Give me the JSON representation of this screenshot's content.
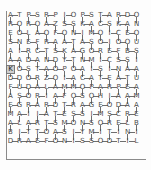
{
  "puzzle": {
    "title": "letter-grid-puzzle",
    "type": "word-grid",
    "rows": 15,
    "cols": 15,
    "cell_size": 9,
    "origin_x": 6,
    "origin_y": 11,
    "colors": {
      "background": "#fdfdfd",
      "letter": "#4a4a4a",
      "link": "#6e6e6e",
      "selection_fill": "#cfcfcf",
      "selection_border": "#7a7a7a",
      "frame": "#8a8a8a"
    },
    "selected_cell": {
      "row": 6,
      "col": 0,
      "letter": "K"
    },
    "letters": [
      [
        "A",
        "T",
        "P",
        "S",
        "R",
        "P",
        "I",
        "O",
        "P",
        "S",
        "T",
        "A",
        "R",
        "D",
        "O"
      ],
      [
        "R",
        "O",
        "R",
        "O",
        "A",
        "Z",
        "S",
        "S",
        "K",
        "A",
        "C",
        "S",
        "K",
        "A",
        "N"
      ],
      [
        "E",
        "O",
        "L",
        "A",
        "O",
        "F",
        "O",
        "N",
        "I",
        "M",
        "O",
        "I",
        "C",
        "E",
        "O"
      ],
      [
        "S",
        "N",
        "E",
        "F",
        "R",
        "A",
        "A",
        "T",
        "A",
        "S",
        "O",
        "I",
        "O",
        "O",
        "U"
      ],
      [
        "A",
        "I",
        "R",
        "C",
        "T",
        "S",
        "K",
        "A",
        "G",
        "O",
        "R",
        "E",
        "F",
        "B",
        "S"
      ],
      [
        "A",
        "A",
        "D",
        "A",
        "N",
        "D",
        "Y",
        "T",
        "N",
        "M",
        "I",
        "C",
        "S",
        "S",
        "I"
      ],
      [
        "K",
        "O",
        "S",
        "T",
        "A",
        "O",
        "P",
        "O",
        "A",
        "I",
        "S",
        "I",
        "N",
        "A",
        "A"
      ],
      [
        "D",
        "D",
        "O",
        "R",
        "Z",
        "O",
        "I",
        "A",
        "C",
        "A",
        "T",
        "E",
        "A",
        "T",
        "U"
      ],
      [
        "F",
        "U",
        "D",
        "A",
        "L",
        "A",
        "M",
        "M",
        "O",
        "P",
        "A",
        "R",
        "P",
        "E",
        "A"
      ],
      [
        "A",
        "S",
        "O",
        "R",
        "I",
        "A",
        "F",
        "O",
        "S",
        "O",
        "H",
        "I",
        "A",
        "A",
        "M"
      ],
      [
        "E",
        "G",
        "R",
        "A",
        "R",
        "D",
        "T",
        "R",
        "A",
        "G",
        "E",
        "O",
        "D",
        "A",
        "A"
      ],
      [
        "M",
        "A",
        "I",
        "I",
        "A",
        "T",
        "E",
        "S",
        "S",
        "I",
        "M",
        "S",
        "C",
        "R",
        "E"
      ],
      [
        "A",
        "L",
        "A",
        "R",
        "T",
        "S",
        "M",
        "O",
        "N",
        "S",
        "O",
        "R",
        "E",
        "L",
        "B"
      ],
      [
        "B",
        "I",
        "T",
        "T",
        "O",
        "A",
        "S",
        "I",
        "Y",
        "M",
        "I",
        "T",
        "I",
        "N",
        "I"
      ],
      [
        "D",
        "R",
        "A",
        "E",
        "F",
        "O",
        "N",
        "I",
        "S",
        "S",
        "O",
        "D",
        "T",
        "I",
        "L"
      ]
    ],
    "links": {
      "horizontal": [
        [
          0,
          0
        ],
        [
          0,
          2
        ],
        [
          0,
          4
        ],
        [
          0,
          6
        ],
        [
          0,
          8
        ],
        [
          0,
          10
        ],
        [
          0,
          12
        ],
        [
          0,
          13
        ],
        [
          1,
          0
        ],
        [
          1,
          2
        ],
        [
          1,
          4
        ],
        [
          1,
          6
        ],
        [
          1,
          8
        ],
        [
          1,
          10
        ],
        [
          1,
          12
        ],
        [
          2,
          1
        ],
        [
          2,
          3
        ],
        [
          2,
          5
        ],
        [
          2,
          7
        ],
        [
          2,
          9
        ],
        [
          2,
          11
        ],
        [
          2,
          13
        ],
        [
          3,
          0
        ],
        [
          3,
          2
        ],
        [
          3,
          4
        ],
        [
          3,
          6
        ],
        [
          3,
          8
        ],
        [
          3,
          10
        ],
        [
          3,
          12
        ],
        [
          4,
          1
        ],
        [
          4,
          3
        ],
        [
          4,
          5
        ],
        [
          4,
          7
        ],
        [
          4,
          9
        ],
        [
          4,
          11
        ],
        [
          4,
          13
        ],
        [
          5,
          0
        ],
        [
          5,
          2
        ],
        [
          5,
          4
        ],
        [
          5,
          6
        ],
        [
          5,
          8
        ],
        [
          5,
          10
        ],
        [
          5,
          12
        ],
        [
          6,
          1
        ],
        [
          6,
          3
        ],
        [
          6,
          4
        ],
        [
          6,
          5
        ],
        [
          6,
          7
        ],
        [
          6,
          9
        ],
        [
          6,
          11
        ],
        [
          6,
          13
        ],
        [
          7,
          0
        ],
        [
          7,
          2
        ],
        [
          7,
          4
        ],
        [
          7,
          6
        ],
        [
          7,
          8
        ],
        [
          7,
          10
        ],
        [
          7,
          12
        ],
        [
          8,
          0
        ],
        [
          8,
          1
        ],
        [
          8,
          2
        ],
        [
          8,
          3
        ],
        [
          8,
          4
        ],
        [
          8,
          5
        ],
        [
          8,
          6
        ],
        [
          8,
          7
        ],
        [
          8,
          8
        ],
        [
          8,
          9
        ],
        [
          8,
          10
        ],
        [
          8,
          11
        ],
        [
          8,
          12
        ],
        [
          8,
          13
        ],
        [
          9,
          1
        ],
        [
          9,
          3
        ],
        [
          9,
          5
        ],
        [
          9,
          7
        ],
        [
          9,
          9
        ],
        [
          9,
          11
        ],
        [
          9,
          13
        ],
        [
          10,
          0
        ],
        [
          10,
          2
        ],
        [
          10,
          4
        ],
        [
          10,
          6
        ],
        [
          10,
          8
        ],
        [
          10,
          10
        ],
        [
          10,
          12
        ],
        [
          11,
          1
        ],
        [
          11,
          3
        ],
        [
          11,
          5
        ],
        [
          11,
          7
        ],
        [
          11,
          9
        ],
        [
          11,
          11
        ],
        [
          11,
          13
        ],
        [
          12,
          0
        ],
        [
          12,
          2
        ],
        [
          12,
          4
        ],
        [
          12,
          6
        ],
        [
          12,
          8
        ],
        [
          12,
          10
        ],
        [
          12,
          12
        ],
        [
          13,
          1
        ],
        [
          13,
          3
        ],
        [
          13,
          5
        ],
        [
          13,
          7
        ],
        [
          13,
          9
        ],
        [
          13,
          11
        ],
        [
          13,
          13
        ],
        [
          14,
          0
        ],
        [
          14,
          1
        ],
        [
          14,
          2
        ],
        [
          14,
          3
        ],
        [
          14,
          4
        ],
        [
          14,
          5
        ],
        [
          14,
          6
        ],
        [
          14,
          7
        ],
        [
          14,
          8
        ],
        [
          14,
          9
        ],
        [
          14,
          10
        ],
        [
          14,
          11
        ],
        [
          14,
          12
        ],
        [
          14,
          13
        ]
      ],
      "vertical": [
        [
          0,
          0
        ],
        [
          0,
          2
        ],
        [
          0,
          4
        ],
        [
          0,
          6
        ],
        [
          0,
          8
        ],
        [
          0,
          10
        ],
        [
          0,
          12
        ],
        [
          0,
          14
        ],
        [
          1,
          1
        ],
        [
          1,
          3
        ],
        [
          1,
          5
        ],
        [
          1,
          7
        ],
        [
          1,
          9
        ],
        [
          1,
          11
        ],
        [
          1,
          13
        ],
        [
          2,
          0
        ],
        [
          2,
          2
        ],
        [
          2,
          4
        ],
        [
          2,
          6
        ],
        [
          2,
          8
        ],
        [
          2,
          10
        ],
        [
          2,
          12
        ],
        [
          2,
          14
        ],
        [
          3,
          1
        ],
        [
          3,
          3
        ],
        [
          3,
          5
        ],
        [
          3,
          7
        ],
        [
          3,
          9
        ],
        [
          3,
          11
        ],
        [
          3,
          13
        ],
        [
          4,
          0
        ],
        [
          4,
          2
        ],
        [
          4,
          4
        ],
        [
          4,
          6
        ],
        [
          4,
          8
        ],
        [
          4,
          10
        ],
        [
          4,
          12
        ],
        [
          4,
          14
        ],
        [
          5,
          1
        ],
        [
          5,
          3
        ],
        [
          5,
          5
        ],
        [
          5,
          7
        ],
        [
          5,
          9
        ],
        [
          5,
          11
        ],
        [
          5,
          13
        ],
        [
          6,
          0
        ],
        [
          6,
          2
        ],
        [
          6,
          4
        ],
        [
          6,
          6
        ],
        [
          6,
          8
        ],
        [
          6,
          10
        ],
        [
          6,
          12
        ],
        [
          6,
          14
        ],
        [
          7,
          1
        ],
        [
          7,
          3
        ],
        [
          7,
          5
        ],
        [
          7,
          7
        ],
        [
          7,
          9
        ],
        [
          7,
          11
        ],
        [
          7,
          13
        ],
        [
          8,
          0
        ],
        [
          8,
          2
        ],
        [
          8,
          4
        ],
        [
          8,
          6
        ],
        [
          8,
          8
        ],
        [
          8,
          10
        ],
        [
          8,
          12
        ],
        [
          8,
          14
        ],
        [
          9,
          1
        ],
        [
          9,
          3
        ],
        [
          9,
          5
        ],
        [
          9,
          7
        ],
        [
          9,
          9
        ],
        [
          9,
          11
        ],
        [
          9,
          13
        ],
        [
          10,
          0
        ],
        [
          10,
          2
        ],
        [
          10,
          4
        ],
        [
          10,
          6
        ],
        [
          10,
          8
        ],
        [
          10,
          10
        ],
        [
          10,
          12
        ],
        [
          10,
          14
        ],
        [
          11,
          1
        ],
        [
          11,
          3
        ],
        [
          11,
          5
        ],
        [
          11,
          7
        ],
        [
          11,
          9
        ],
        [
          11,
          11
        ],
        [
          11,
          13
        ],
        [
          12,
          0
        ],
        [
          12,
          2
        ],
        [
          12,
          4
        ],
        [
          12,
          6
        ],
        [
          12,
          8
        ],
        [
          12,
          10
        ],
        [
          12,
          12
        ],
        [
          12,
          14
        ],
        [
          13,
          1
        ],
        [
          13,
          3
        ],
        [
          13,
          5
        ],
        [
          13,
          7
        ],
        [
          13,
          9
        ],
        [
          13,
          11
        ],
        [
          13,
          13
        ]
      ]
    },
    "frame": {
      "left_rule": {
        "x": 6,
        "y": 11,
        "height": 148
      },
      "bottom_rule": {
        "x": 6,
        "y": 159,
        "width": 140
      }
    }
  }
}
